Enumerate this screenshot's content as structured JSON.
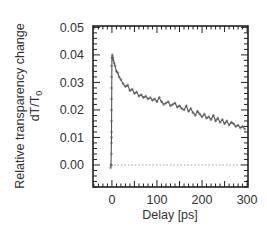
{
  "chart_data": {
    "type": "line",
    "title": "",
    "xlabel": "Delay [ps]",
    "ylabel_line1": "Relative transparency change",
    "ylabel_line2_main": "dT/T",
    "ylabel_line2_sub": "0",
    "xlim": [
      -42,
      302
    ],
    "ylim": [
      -0.008,
      0.0505
    ],
    "x_ticks": [
      0,
      100,
      200,
      300
    ],
    "x_tick_labels": [
      "0",
      "100",
      "200",
      "300"
    ],
    "y_ticks": [
      0.0,
      0.01,
      0.02,
      0.03,
      0.04,
      0.05
    ],
    "y_tick_labels": [
      "0.00",
      "0.01",
      "0.02",
      "0.03",
      "0.04",
      "0.05"
    ],
    "x_minor_step": 10,
    "y_minor_step": 0.002,
    "grid": false,
    "legend": null,
    "baseline": {
      "y": 0.0,
      "style": "dotted"
    },
    "series": [
      {
        "name": "dT/T0",
        "x": [
          -3,
          -2,
          -1,
          0,
          1,
          2,
          3,
          5,
          7,
          10,
          13,
          16,
          20,
          25,
          30,
          35,
          40,
          45,
          50,
          55,
          60,
          65,
          70,
          75,
          80,
          85,
          90,
          95,
          100,
          105,
          110,
          115,
          120,
          125,
          130,
          135,
          140,
          145,
          150,
          155,
          160,
          165,
          170,
          175,
          180,
          185,
          190,
          195,
          200,
          205,
          210,
          215,
          220,
          225,
          230,
          235,
          240,
          245,
          250,
          255,
          260,
          265,
          270,
          275,
          280,
          285,
          290,
          295
        ],
        "values": [
          -0.001,
          0.0,
          0.01,
          0.039,
          0.04,
          0.039,
          0.038,
          0.037,
          0.036,
          0.034,
          0.0335,
          0.032,
          0.031,
          0.0295,
          0.0285,
          0.029,
          0.027,
          0.0275,
          0.026,
          0.0265,
          0.025,
          0.0255,
          0.0245,
          0.025,
          0.024,
          0.0245,
          0.0235,
          0.024,
          0.023,
          0.0245,
          0.023,
          0.022,
          0.0225,
          0.023,
          0.0215,
          0.022,
          0.0225,
          0.021,
          0.0215,
          0.0205,
          0.02,
          0.0215,
          0.0195,
          0.0205,
          0.019,
          0.018,
          0.0195,
          0.0185,
          0.0175,
          0.0185,
          0.017,
          0.0175,
          0.0165,
          0.018,
          0.016,
          0.017,
          0.0155,
          0.0165,
          0.015,
          0.016,
          0.0145,
          0.0155,
          0.015,
          0.014,
          0.0145,
          0.0135,
          0.014,
          0.013
        ],
        "marker": "small open circles",
        "color": "#555555"
      }
    ]
  }
}
